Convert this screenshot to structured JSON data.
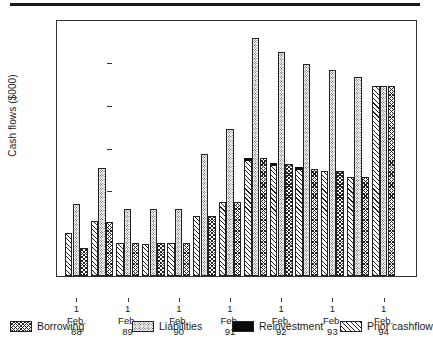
{
  "chart_data": {
    "type": "bar",
    "title": "",
    "xlabel": "",
    "ylabel": "Cash flows ($000)",
    "ylim": [
      2000,
      14000
    ],
    "yticks": [
      2000,
      4000,
      6000,
      8000,
      10000,
      12000,
      14000
    ],
    "ytick_labels": [
      "2000",
      "4000",
      "6000",
      "8000",
      "10000",
      "12000",
      "14000"
    ],
    "grid": false,
    "legend_position": "bottom",
    "axis_tick_categories": [
      "1\nFeb.\n88",
      "1\nFeb.\n89",
      "1\nFeb.\n90",
      "1\nFeb.\n91",
      "1\nFeb.\n92",
      "1\nFeb.\n93",
      "1\nFeb.\n94"
    ],
    "categories": [
      "1 Feb. 88",
      "1 Aug. 88",
      "1 Feb. 89",
      "1 Aug. 89",
      "1 Feb. 90",
      "1 Aug. 90",
      "1 Feb. 91",
      "1 Aug. 91",
      "1 Feb. 92",
      "1 Aug. 92",
      "1 Feb. 93",
      "1 Aug. 93",
      "1 Feb. 94"
    ],
    "series": [
      {
        "name": "Prior cashflow",
        "pattern": "diagonal-hatch",
        "values": [
          4030,
          4550,
          3520,
          3500,
          3520,
          4780,
          5440,
          7400,
          7180,
          6980,
          6920,
          6640,
          10890
        ]
      },
      {
        "name": "Liabilities",
        "pattern": "dotted",
        "values": [
          5370,
          7030,
          5120,
          5120,
          5120,
          7680,
          8880,
          13100,
          12480,
          11880,
          11600,
          11280,
          10890
        ]
      },
      {
        "name": "Borrowing",
        "pattern": "cross-hatch",
        "values": [
          3330,
          4540,
          3520,
          3520,
          3520,
          4820,
          5450,
          7490,
          7230,
          7010,
          6900,
          6640,
          10890
        ]
      },
      {
        "name": "Reinvestment",
        "pattern": "solid-black",
        "note": "black cap drawn on top of the Prior cashflow bar",
        "values": [
          0,
          0,
          0,
          0,
          0,
          0,
          0,
          7490,
          7250,
          7040,
          0,
          0,
          0
        ]
      }
    ]
  },
  "legend": {
    "items": [
      {
        "label": "Borrowing",
        "swatch": "cross-hatch",
        "color": "#1a1a1a"
      },
      {
        "label": "Liabilities",
        "swatch": "dotted",
        "color": "#333333"
      },
      {
        "label": "Reinvestment",
        "swatch": "solid-black",
        "color": "#0a0a0a"
      },
      {
        "label": "Prior cashflow",
        "swatch": "diagonal-hatch",
        "color": "#222222"
      }
    ]
  }
}
